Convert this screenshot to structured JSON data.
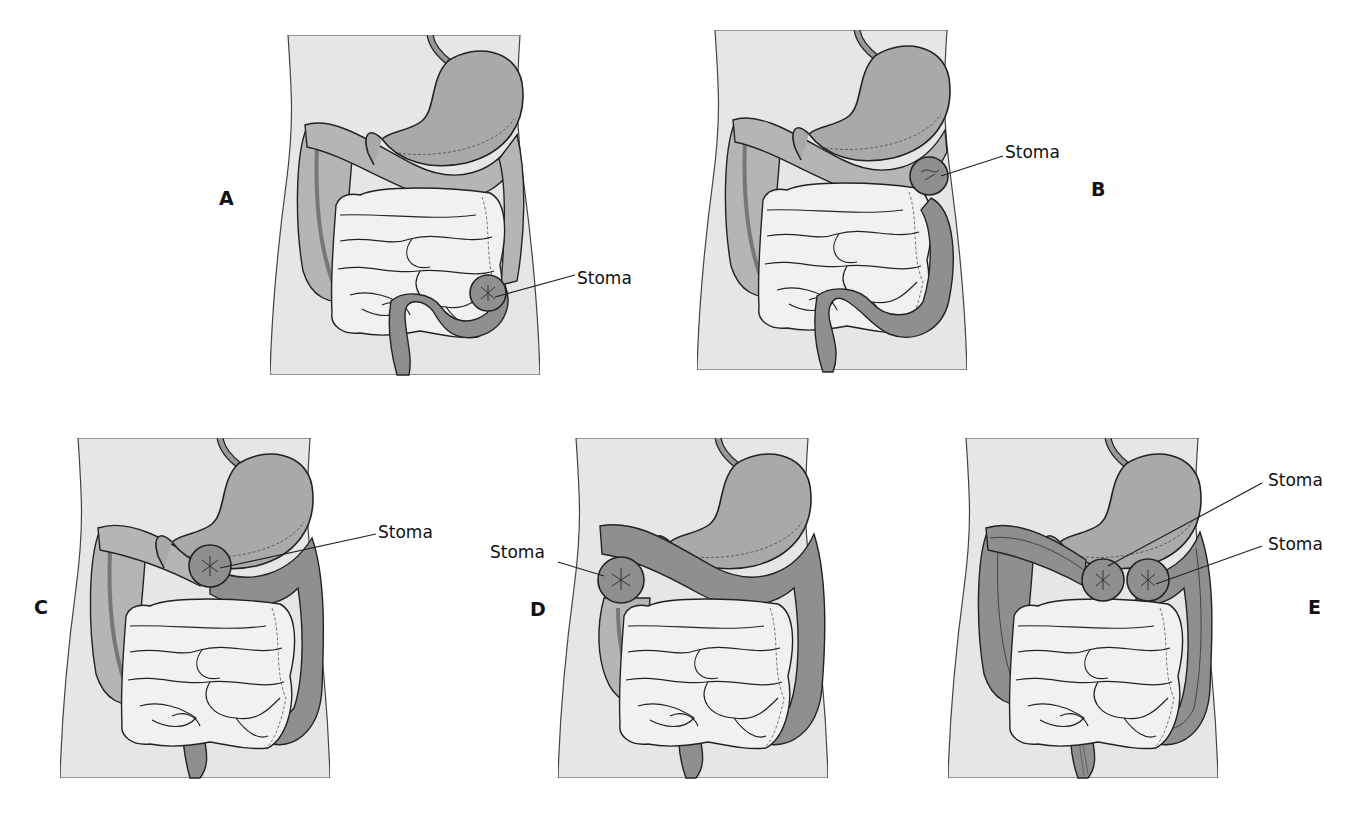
{
  "figure": {
    "colors": {
      "torso": "#e6e6e6",
      "colon_proximal": "#b5b5b5",
      "colon_active": "#8f8f8f",
      "stomach": "#a9a9a9",
      "small_intestine": "#f1f1f1",
      "outline": "#222222"
    },
    "panels": [
      {
        "id": "A",
        "label": "A",
        "stoma_labels": [
          "Stoma"
        ],
        "stoma_site": "sigmoid colon (left lower abdomen)"
      },
      {
        "id": "B",
        "label": "B",
        "stoma_labels": [
          "Stoma"
        ],
        "stoma_site": "descending colon (left upper abdomen)"
      },
      {
        "id": "C",
        "label": "C",
        "stoma_labels": [
          "Stoma"
        ],
        "stoma_site": "transverse colon (center)"
      },
      {
        "id": "D",
        "label": "D",
        "stoma_labels": [
          "Stoma"
        ],
        "stoma_site": "ascending colon (right abdomen)"
      },
      {
        "id": "E",
        "label": "E",
        "stoma_labels": [
          "Stoma",
          "Stoma"
        ],
        "stoma_site": "double-barrel transverse colostomy"
      }
    ]
  }
}
